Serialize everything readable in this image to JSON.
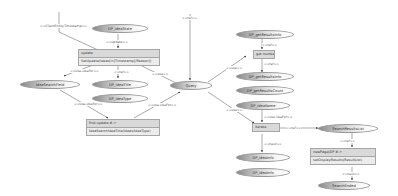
{
  "diagram": {
    "top_labels": {
      "left_stub": "<<ClientEntityTimestamp>>",
      "center_stub": "<<ref>>"
    },
    "nodes": {
      "dp_ideastate": "DP_ideaState",
      "update_box": {
        "header": "update",
        "row": "SetUpdate(Ideas[in]Timestamp[/Reason])"
      },
      "ideasearchfield": "IdeaSearchField",
      "dp_ideatitle": "DP_ideaTitle",
      "dp_ideatype": "DP_ideaType",
      "findupdate_box": {
        "header": "find update   #->",
        "row": "IdeaSearchIdeaTitle(Ideas/IdeaType)"
      },
      "query": "Query",
      "dp_getresultsinfo": "DP_getResultsInfo",
      "get_numbers": "get numbers",
      "dp_getresultsinfo2": "DP_getResultsInfo",
      "dp_getresultsinfo3": "DP_getResultsCount",
      "dp_ideaname": "DP_ideaName",
      "iterate": "iterate",
      "searchresults_out": "SearchResultsList",
      "dp_ideainfo1": "DP_ideaInfo",
      "dp_ideainfo2": "DP_ideaInfo",
      "newpage_box": {
        "header": "newPage(DP   #->",
        "row": "setDisplayResults(ResultList)"
      },
      "search_ended": "SearchEnded"
    },
    "edge_labels": {
      "e1": "<<update>>",
      "e2": "<<ref>>",
      "e3": "<<use>>",
      "e4": "<<Use-UseFor>>",
      "e5": "<<Use-UseFor>>",
      "e6": "<<ref>>",
      "e7": "<<use>>",
      "e8": "<<ref>>",
      "e9": "<<next>>",
      "e10": "<<use-UseFor>>",
      "e11": "<<use>>",
      "e12": "<<ref>>",
      "e13": "<<next>>",
      "e14": "<<ref>>",
      "e15": "<<use-UseFor>>",
      "e16": "<<next>>"
    }
  }
}
